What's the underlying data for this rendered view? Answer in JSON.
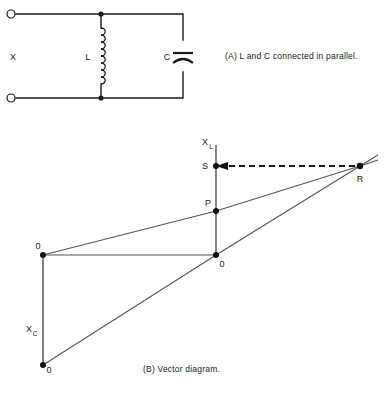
{
  "figure": {
    "panel_a": {
      "caption": "(A)  L and C connected in parallel.",
      "caption_id": "(A)",
      "terminal_label": "X",
      "inductor_label": "L",
      "capacitor_label": "C"
    },
    "panel_b": {
      "caption": "(B)  Vector diagram.",
      "caption_id": "(B)",
      "axis_xl": "X",
      "axis_xl_sub": "L",
      "axis_xc": "X",
      "axis_xc_sub": "C",
      "point_s": "S",
      "point_p": "P",
      "point_r": "R",
      "origin_left": "0",
      "origin_center": "0",
      "origin_bottom": "0"
    }
  }
}
